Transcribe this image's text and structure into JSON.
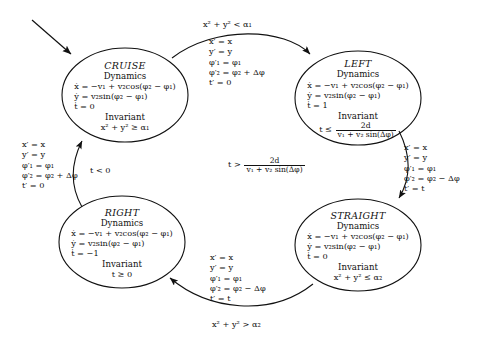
{
  "diagram": {
    "type": "state-machine",
    "initial_state": "CRUISE",
    "states": [
      {
        "id": "cruise",
        "name": "CRUISE",
        "dynamics_label": "Dynamics",
        "dynamics": [
          "ẋ = −v₁ + v₂cos(φ₂ − φ₁)",
          "ẏ = v₂sin(φ₂ − φ₁)",
          "ṫ = 0"
        ],
        "invariant_label": "Invariant",
        "invariant": "x² + y² ≥ α₁"
      },
      {
        "id": "left",
        "name": "LEFT",
        "dynamics_label": "Dynamics",
        "dynamics": [
          "ẋ = −v₁ + v₂cos(φ₂ − φ₁)",
          "ẏ = v₂sin(φ₂ − φ₁)",
          "ṫ = 1"
        ],
        "invariant_label": "Invariant",
        "invariant_lhs": "t ≤",
        "invariant_num": "2d",
        "invariant_den": "v₁ + v₂ sin(Δφ)"
      },
      {
        "id": "right",
        "name": "RIGHT",
        "dynamics_label": "Dynamics",
        "dynamics": [
          "ẋ = −v₁ + v₂cos(φ₂ − φ₁)",
          "ẏ = v₂sin(φ₂ − φ₁)",
          "ṫ = −1"
        ],
        "invariant_label": "Invariant",
        "invariant": "t ≥ 0"
      },
      {
        "id": "straight",
        "name": "STRAIGHT",
        "dynamics_label": "Dynamics",
        "dynamics": [
          "ẋ = −v₁ + v₂cos(φ₂ − φ₁)",
          "ẏ = v₂sin(φ₂ − φ₁)",
          "ṫ = 0"
        ],
        "invariant_label": "Invariant",
        "invariant": "x² + y² ≤ α₂"
      }
    ],
    "transitions": [
      {
        "id": "cruise-to-left",
        "from": "CRUISE",
        "to": "LEFT",
        "guard": "x² + y² < α₁",
        "resets": [
          "x′ = x",
          "y′ = y",
          "φ′₁ = φ₁",
          "φ′₂ = φ₂ + Δφ",
          "t′ = 0"
        ]
      },
      {
        "id": "left-to-straight",
        "from": "LEFT",
        "to": "STRAIGHT",
        "guard_lhs": "t >",
        "guard_num": "2d",
        "guard_den": "v₁ + v₂ sin(Δφ)",
        "resets": [
          "x′ = x",
          "y′ = y",
          "φ′₁ = φ₁",
          "φ′₂ = φ₂ − Δφ",
          "t′ = t"
        ]
      },
      {
        "id": "straight-to-right",
        "from": "STRAIGHT",
        "to": "RIGHT",
        "guard": "x² + y² > α₂",
        "resets": [
          "x′ = x",
          "y′ = y",
          "φ′₁ = φ₁",
          "φ′₂ = φ₂ − Δφ",
          "t′ = t"
        ]
      },
      {
        "id": "right-to-cruise",
        "from": "RIGHT",
        "to": "CRUISE",
        "guard": "t < 0",
        "resets": [
          "x′ = x",
          "y′ = y",
          "φ′₁ = φ₁",
          "φ′₂ = φ₂ + Δφ",
          "t′ = 0"
        ]
      }
    ]
  }
}
